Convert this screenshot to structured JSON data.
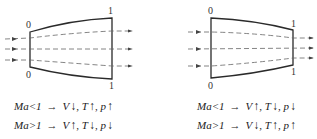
{
  "diagrams": [
    {
      "id": "diverging",
      "labels": {
        "inlet_top": "0",
        "inlet_bottom": "0",
        "outlet_top": "1",
        "outlet_bottom": "1"
      },
      "equations": [
        {
          "condition": "Ma<1",
          "arrow": "→",
          "V": "V",
          "V_dir": "↓",
          "sep1": ",",
          "T": "T",
          "T_dir": "↑",
          "sep2": ",",
          "p": "p",
          "p_dir": "↑"
        },
        {
          "condition": "Ma>1",
          "arrow": "→",
          "V": "V",
          "V_dir": "↑",
          "sep1": ",",
          "T": "T",
          "T_dir": "↓",
          "sep2": ",",
          "p": "p",
          "p_dir": "↓"
        }
      ]
    },
    {
      "id": "converging",
      "labels": {
        "inlet_top": "0",
        "inlet_bottom": "0",
        "outlet_top": "1",
        "outlet_bottom": "1"
      },
      "equations": [
        {
          "condition": "Ma<1",
          "arrow": "→",
          "V": "V",
          "V_dir": "↑",
          "sep1": ",",
          "T": "T",
          "T_dir": "↓",
          "sep2": ",",
          "p": "p",
          "p_dir": "↓"
        },
        {
          "condition": "Ma>1",
          "arrow": "→",
          "V": "V",
          "V_dir": "↓",
          "sep1": ",",
          "T": "T",
          "T_dir": "↑",
          "sep2": ",",
          "p": "p",
          "p_dir": "↑"
        }
      ]
    }
  ],
  "colors": {
    "line": "#2a2a2a",
    "flow": "#555555"
  }
}
